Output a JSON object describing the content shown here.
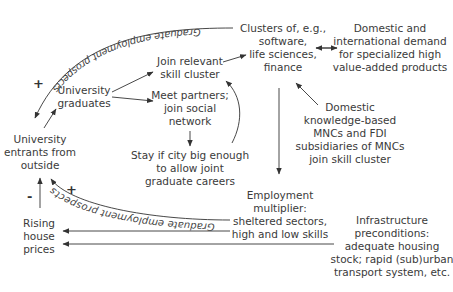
{
  "nodes": {
    "clusters": [
      "Clusters of, e.g.,",
      "software,",
      "life sciences,",
      "finance"
    ],
    "demand": [
      "Domestic and",
      "international demand",
      "for specialized high",
      "value-added products"
    ],
    "join_cluster": [
      "Join relevant",
      "skill cluster"
    ],
    "graduates": [
      "University",
      "graduates"
    ],
    "meet_partners": [
      "Meet partners;",
      "join social",
      "network"
    ],
    "mncs": [
      "Domestic",
      "knowledge-based",
      "MNCs and FDI",
      "subsidiaries of MNCs",
      "join skill cluster"
    ],
    "entrants": [
      "University",
      "entrants from",
      "outside"
    ],
    "stay": [
      "Stay if city big enough",
      "to allow joint",
      "graduate careers"
    ],
    "multiplier": [
      "Employment",
      "multiplier:",
      "sheltered sectors,",
      "high and low skills"
    ],
    "house_prices": [
      "Rising",
      "house",
      "prices"
    ],
    "infrastructure": [
      "Infrastructure",
      "preconditions:",
      "adequate housing",
      "stock; rapid (sub)urban",
      "transport system, etc."
    ]
  },
  "curve_labels": {
    "top": "Graduate employment prospects",
    "bottom": "Graduate employment prospects"
  },
  "signs": {
    "top_plus": "+",
    "bottom_plus": "+",
    "minus": "-"
  }
}
